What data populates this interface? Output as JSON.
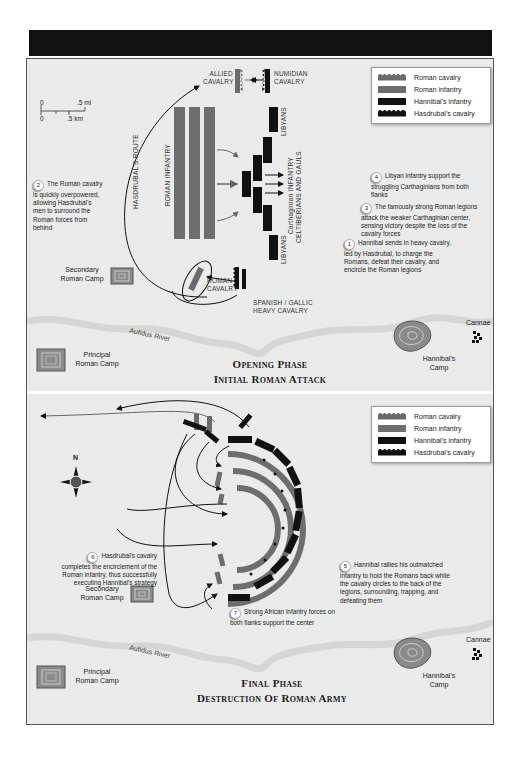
{
  "header": {
    "title": ""
  },
  "legend_items": [
    {
      "label": "Roman cavalry",
      "color": "#6b6b6b",
      "style": "serrated"
    },
    {
      "label": "Roman infantry",
      "color": "#6e6e6e",
      "style": "bar"
    },
    {
      "label": "Hannibal's infantry",
      "color": "#111111",
      "style": "bar"
    },
    {
      "label": "Hasdrubal's cavalry",
      "color": "#111111",
      "style": "serrated"
    }
  ],
  "opening": {
    "title_line1": "Opening Phase",
    "title_line2": "Initial Roman Attack",
    "scale": {
      "mi_start": "0",
      "mi_end": ".5 mi",
      "km_start": "0",
      "km_end": ".5 km"
    },
    "labels": {
      "allied_cavalry": "ALLIED CAVALRY",
      "numidian_cavalry": "NUMIDIAN CAVALRY",
      "libyans_top": "LIBYANS",
      "libyans_bottom": "LIBYANS",
      "roman_infantry": "ROMAN INFANTRY",
      "hasdrubals_route": "HASDRUBAL'S ROUTE",
      "carthaginian_line1": "Carthaginian INFANTRY",
      "carthaginian_line2": "CELTIBERIANS AND GAULS",
      "roman_cavalry": "ROMAN CAVALRY",
      "spanish_gallic": "SPANISH / GALLIC HEAVY CAVALRY",
      "secondary_camp": "Secondary Roman Camp",
      "principal_camp": "Principal Roman Camp",
      "river": "Aufidus River",
      "hannibals_camp": "Hannibal's Camp",
      "cannae": "Cannae"
    },
    "notes": [
      {
        "num": "2",
        "text": "The Roman cavalry is quickly overpowered, allowing Hasdrubal's men to surround the Roman forces from behind"
      },
      {
        "num": "4",
        "text": "Libyan infantry support the struggling Carthaginians from both flanks"
      },
      {
        "num": "3",
        "text": "The famously strong Roman legions attack the weaker Carthaginian center, sensing victory despite the loss of the cavalry forces"
      },
      {
        "num": "1",
        "text": "Hannibal sends in heavy cavalry, led by Hasdrubal, to charge the Romans, defeat their cavalry, and encircle the Roman legions"
      }
    ]
  },
  "final": {
    "title_line1": "Final Phase",
    "title_line2": "Destruction Of Roman Army",
    "compass_label": "N",
    "labels": {
      "secondary_camp": "Secondary Roman Camp",
      "principal_camp": "Principal Roman Camp",
      "river": "Aufidus River",
      "hannibals_camp": "Hannibal's Camp",
      "cannae": "Cannae"
    },
    "notes": [
      {
        "num": "6",
        "text": "Hasdrubal's cavalry completes the encirclement of the Roman infantry, thus successfully executing Hannibal's strategy"
      },
      {
        "num": "5",
        "text": "Hannibal rallies his outmatched infantry to hold the Romans back while the cavalry circles to the back of the legions, surrounding, trapping, and defeating them"
      },
      {
        "num": "7",
        "text": "Strong African infantry forces on both flanks support the center"
      }
    ]
  }
}
